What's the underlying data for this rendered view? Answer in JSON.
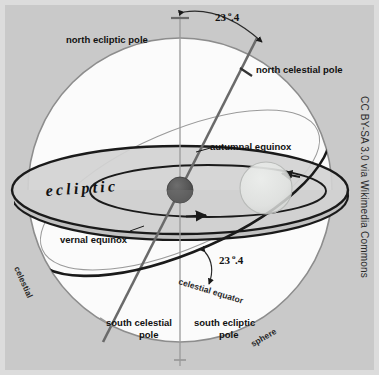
{
  "figure": {
    "background_color": "#c9c9c9",
    "frame_color": "#dcdcdc",
    "sphere_fill": "#fbfbfb",
    "disk_fill": "#d2d2d2",
    "line_color": "#1a1a1a"
  },
  "labels": {
    "north_ecliptic_pole": "north ecliptic pole",
    "north_celestial_pole": "north celestial pole",
    "autumnal_equinox": "autumnal equinox",
    "vernal_equinox": "vernal equinox",
    "ecliptic": "ecliptic",
    "celestial_equator": "celestial equator",
    "south_celestial_pole_line1": "south celestial",
    "south_celestial_pole_line2": "pole",
    "south_ecliptic_pole_line1": "south ecliptic",
    "south_ecliptic_pole_line2": "pole",
    "celestial": "celestial",
    "sphere": "sphere"
  },
  "angles": {
    "top_value": "23",
    "top_degree": "o",
    "top_fraction": ".4",
    "bottom_value": "23",
    "bottom_degree": "o",
    "bottom_fraction": ".4"
  },
  "bodies": {
    "sun": "sun-sphere",
    "earth": "earth-sphere"
  },
  "attribution": {
    "text": "CC BY-SA 3.0 via Wikimedia Commons"
  }
}
